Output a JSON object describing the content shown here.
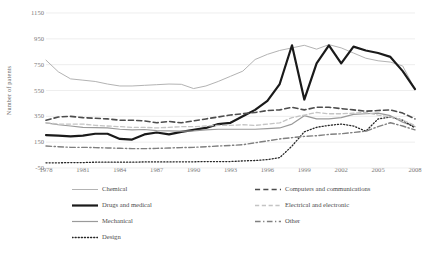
{
  "chart_data": {
    "type": "line",
    "title": "",
    "xlabel": "",
    "ylabel": "Number of patents",
    "ylim": [
      -50,
      1150
    ],
    "ytick_values": [
      -50,
      150,
      350,
      550,
      750,
      950,
      1150
    ],
    "ytick_labels": [
      "-50",
      "150",
      "350",
      "550",
      "750",
      "950",
      "1150"
    ],
    "xlim": [
      1978,
      2008
    ],
    "xtick_values": [
      1978,
      1981,
      1984,
      1987,
      1990,
      1993,
      1996,
      1999,
      2002,
      2005,
      2008
    ],
    "xtick_labels": [
      "1978",
      "1981",
      "1984",
      "1987",
      "1990",
      "1993",
      "1996",
      "1999",
      "2002",
      "2005",
      "2008"
    ],
    "grid": "horizontal",
    "legend_position": "bottom",
    "x": [
      1978,
      1979,
      1980,
      1981,
      1982,
      1983,
      1984,
      1985,
      1986,
      1987,
      1988,
      1989,
      1990,
      1991,
      1992,
      1993,
      1994,
      1995,
      1996,
      1997,
      1998,
      1999,
      2000,
      2001,
      2002,
      2003,
      2004,
      2005,
      2006,
      2007,
      2008
    ],
    "series": [
      {
        "name": "Chemical",
        "color": "#b3b3b3",
        "style": "solid",
        "width": 1.0,
        "values": [
          785,
          695,
          640,
          630,
          620,
          600,
          585,
          585,
          590,
          595,
          600,
          598,
          565,
          585,
          620,
          660,
          700,
          790,
          830,
          860,
          880,
          900,
          870,
          905,
          880,
          840,
          800,
          780,
          770,
          740,
          560
        ]
      },
      {
        "name": "Drugs and medical",
        "color": "#1a1a1a",
        "style": "solid",
        "width": 2.2,
        "values": [
          205,
          200,
          195,
          200,
          215,
          215,
          175,
          170,
          210,
          225,
          210,
          230,
          245,
          260,
          290,
          300,
          350,
          400,
          470,
          600,
          900,
          480,
          760,
          900,
          760,
          890,
          860,
          840,
          810,
          700,
          560
        ]
      },
      {
        "name": "Mechanical",
        "color": "#9a9a9a",
        "style": "solid",
        "width": 1.2,
        "values": [
          300,
          285,
          275,
          265,
          262,
          260,
          250,
          245,
          248,
          240,
          238,
          235,
          238,
          245,
          250,
          250,
          250,
          250,
          255,
          260,
          290,
          355,
          330,
          330,
          340,
          365,
          370,
          375,
          355,
          305,
          270
        ]
      },
      {
        "name": "Design",
        "color": "#262626",
        "style": "dotted",
        "width": 1.3,
        "values": [
          -10,
          -10,
          -8,
          -8,
          -5,
          -5,
          -5,
          -5,
          -3,
          -3,
          -3,
          -2,
          -2,
          0,
          0,
          0,
          5,
          8,
          15,
          30,
          120,
          230,
          265,
          280,
          290,
          275,
          235,
          330,
          345,
          320,
          260
        ]
      },
      {
        "name": "Computers and communications",
        "color": "#4d4d4d",
        "style": "dashed",
        "width": 1.6,
        "values": [
          320,
          345,
          350,
          340,
          335,
          330,
          320,
          320,
          315,
          300,
          310,
          300,
          315,
          330,
          345,
          360,
          370,
          380,
          395,
          400,
          420,
          400,
          420,
          420,
          410,
          400,
          390,
          395,
          400,
          375,
          330
        ]
      },
      {
        "name": "Electrical and electronic",
        "color": "#c4c4c4",
        "style": "dashed",
        "width": 1.3,
        "values": [
          300,
          290,
          290,
          290,
          280,
          275,
          270,
          265,
          265,
          260,
          265,
          270,
          270,
          275,
          280,
          280,
          285,
          280,
          290,
          300,
          340,
          360,
          380,
          370,
          370,
          375,
          380,
          360,
          345,
          320,
          280
        ]
      },
      {
        "name": "Other",
        "color": "#808080",
        "style": "dashdot",
        "width": 1.4,
        "values": [
          120,
          115,
          110,
          110,
          108,
          105,
          103,
          100,
          100,
          102,
          105,
          108,
          110,
          115,
          120,
          125,
          130,
          145,
          160,
          175,
          185,
          195,
          200,
          210,
          215,
          225,
          235,
          270,
          300,
          275,
          245
        ]
      }
    ]
  },
  "legend": {
    "items": [
      {
        "label": "Chemical",
        "series_index": 0
      },
      {
        "label": "Drugs and medical",
        "series_index": 1
      },
      {
        "label": "Mechanical",
        "series_index": 2
      },
      {
        "label": "Design",
        "series_index": 3
      },
      {
        "label": "Computers and communications",
        "series_index": 4
      },
      {
        "label": "Electrical and electronic",
        "series_index": 5
      },
      {
        "label": "Other",
        "series_index": 6
      }
    ]
  }
}
